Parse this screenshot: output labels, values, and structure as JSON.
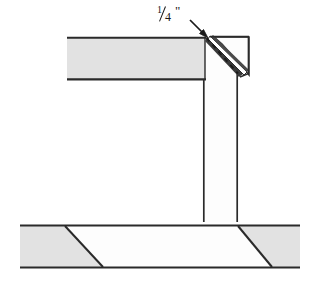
{
  "diagram": {
    "annotation": {
      "name": "quarter-inch-dimension",
      "numerator": "1",
      "denominator": "4",
      "unit_mark": "\"",
      "full_text": "1/4\""
    },
    "colors": {
      "outline": "#1a1a1a",
      "fill_gray": "#e2e2e2",
      "fill_white": "#fdfdfd",
      "background": "#ffffff",
      "dash": "#1a1a1a"
    },
    "parts": [
      {
        "name": "horizontal-beam",
        "fill": "gray",
        "x": 67,
        "y": 37,
        "width": 138,
        "height": 43
      },
      {
        "name": "vertical-post",
        "fill": "white",
        "x": 203,
        "y": 37,
        "width": 35,
        "height": 185
      },
      {
        "name": "folded-flap",
        "fill": "white",
        "description": "triangular folded-back flap at top right of post"
      },
      {
        "name": "base-board",
        "fill": "mixed",
        "x": 20,
        "y": 225,
        "width": 280,
        "height": 43,
        "sections": [
          "gray",
          "white",
          "gray"
        ]
      }
    ],
    "base_diagonals": [
      {
        "name": "left-diagonal",
        "top_x": 65,
        "bottom_x": 103
      },
      {
        "name": "right-diagonal",
        "top_x": 238,
        "bottom_x": 272
      }
    ],
    "leader_arrow": {
      "name": "dimension-leader-arrow",
      "from_x": 190,
      "from_y": 20,
      "to_x": 208,
      "to_y": 38
    },
    "fold_line": {
      "name": "dashed-fold-line",
      "style": "dashed",
      "from_x": 207,
      "from_y": 38,
      "to_x": 238,
      "to_y": 73
    }
  }
}
